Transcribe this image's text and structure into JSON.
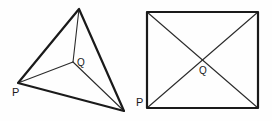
{
  "figure": {
    "background_color": "#fefefe",
    "stroke_color": "#1a1a1a",
    "inner_stroke_color": "#2b2b2b",
    "width": 272,
    "height": 121,
    "shapes": [
      {
        "id": "left-figure",
        "name": "tetrahedron",
        "description": "Triangular pyramid drawn in oblique projection with interior point Q joined to three visible vertices",
        "outline_points": "79,9 18,83 124,111",
        "interior_point": {
          "label": "Q",
          "x": 73,
          "y": 62
        },
        "labels": [
          {
            "text": "P",
            "x": 12,
            "y": 96
          },
          {
            "text": "Q",
            "x": 77,
            "y": 66
          }
        ],
        "interior_edges": [
          {
            "from": "79,9",
            "to": "73,62"
          },
          {
            "from": "18,83",
            "to": "73,62"
          },
          {
            "from": "124,111",
            "to": "73,62"
          }
        ]
      },
      {
        "id": "right-figure",
        "name": "square-pyramid",
        "description": "Square drawn with both diagonals crossing at interior point Q",
        "outline_points": "147,12 258,12 258,108 147,108",
        "interior_point": {
          "label": "Q",
          "x": 202,
          "y": 60
        },
        "labels": [
          {
            "text": "P",
            "x": 136,
            "y": 106
          },
          {
            "text": "Q",
            "x": 199,
            "y": 74
          }
        ],
        "interior_edges": [
          {
            "from": "147,12",
            "to": "258,108"
          },
          {
            "from": "258,12",
            "to": "147,108"
          }
        ]
      }
    ],
    "labels": {
      "left_vertex_p": "P",
      "left_point_q": "Q",
      "right_vertex_p": "P",
      "right_point_q": "Q"
    }
  }
}
